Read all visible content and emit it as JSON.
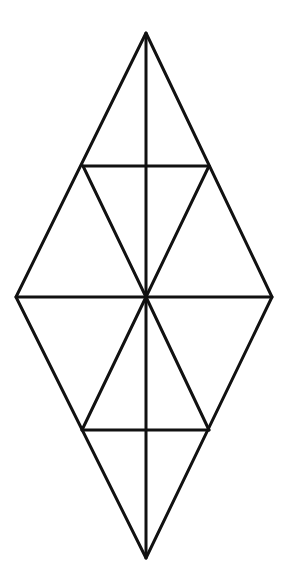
{
  "diagram": {
    "type": "rhombus-triangle-subdivision",
    "stroke_color": "#111111",
    "background": "#ffffff",
    "stroke_width": 3,
    "vertices": {
      "top": [
        146,
        33
      ],
      "left": [
        16,
        297
      ],
      "right": [
        272,
        297
      ],
      "bottom": [
        146,
        558
      ],
      "center": [
        146,
        297
      ],
      "upper_left_mid": [
        83,
        166
      ],
      "upper_right_mid": [
        209,
        166
      ],
      "lower_left_mid": [
        82,
        430
      ],
      "lower_right_mid": [
        209,
        430
      ]
    }
  }
}
